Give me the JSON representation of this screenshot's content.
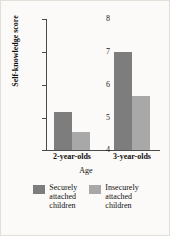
{
  "chart_data": {
    "type": "bar",
    "title": "",
    "xlabel": "Age",
    "ylabel": "Self-knowledge score",
    "categories": [
      "2-year-olds",
      "3-year-olds"
    ],
    "yticks": [
      4,
      5,
      6,
      7,
      8
    ],
    "ylim": [
      4,
      8
    ],
    "grid": false,
    "legend_position": "bottom",
    "series": [
      {
        "name": "Securely\nattached\nchildren",
        "legend_label": "Securely\nattached\nchildren",
        "color": "#7d7d7d",
        "values": [
          5.15,
          7.0
        ]
      },
      {
        "name": "Insecurely\nattached\nchildren",
        "legend_label": "Insecurely\nattached\nchildren",
        "color": "#a8a8a8",
        "values": [
          4.55,
          5.65
        ]
      }
    ]
  },
  "axis": {
    "tick_4": "4",
    "tick_5": "5",
    "tick_6": "6",
    "tick_7": "7",
    "tick_8": "8",
    "group_0": "2-year-olds",
    "group_1": "3-year-olds",
    "x_title": "Age",
    "y_title": "Self-knowledge score"
  },
  "legend": {
    "item_0": "Securely\nattached\nchildren",
    "item_1": "Insecurely\nattached\nchildren"
  }
}
